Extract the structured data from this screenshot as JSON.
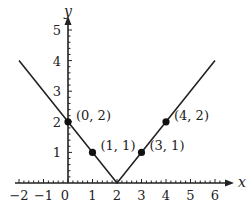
{
  "chart_data": {
    "type": "line",
    "title": "",
    "function": "y = |x - 2|",
    "xlabel": "x",
    "ylabel": "y",
    "xlim": [
      -2,
      6
    ],
    "ylim": [
      0,
      5
    ],
    "grid": false,
    "x_ticks": [
      -2,
      -1,
      0,
      1,
      2,
      3,
      4,
      5,
      6
    ],
    "x_tick_labels": [
      "−2",
      "−1",
      "0",
      "1",
      "2",
      "3",
      "4",
      "5",
      "6"
    ],
    "y_ticks": [
      1,
      2,
      3,
      4,
      5
    ],
    "y_tick_labels": [
      "1",
      "2",
      "3",
      "4",
      "5"
    ],
    "series": [
      {
        "name": "graph",
        "x": [
          -2,
          2,
          6
        ],
        "y": [
          4,
          0,
          4
        ],
        "color": "#222222"
      }
    ],
    "points": [
      {
        "x": 0,
        "y": 2,
        "label": "(0, 2)"
      },
      {
        "x": 1,
        "y": 1,
        "label": "(1, 1)"
      },
      {
        "x": 3,
        "y": 1,
        "label": "(3, 1)"
      },
      {
        "x": 4,
        "y": 2,
        "label": "(4, 2)"
      }
    ],
    "line_color": "#222222"
  }
}
